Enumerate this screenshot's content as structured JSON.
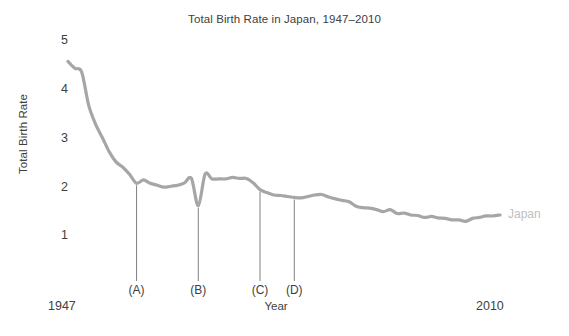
{
  "chart_data": {
    "type": "line",
    "title": "Total Birth Rate in Japan, 1947–2010",
    "xlabel": "Year",
    "ylabel": "Total Birth Rate",
    "xlim": [
      1947,
      2010
    ],
    "ylim": [
      0.55,
      5
    ],
    "grid": false,
    "legend_position": "right-inline",
    "x_tick_labels": [
      "1947",
      "2010"
    ],
    "y_tick_labels": [
      "5",
      "4",
      "3",
      "2",
      "1"
    ],
    "y_ticks": [
      5,
      4,
      3,
      2,
      1
    ],
    "line_color": "#a6a6a6",
    "label_color": "#bfbfbf",
    "series": [
      {
        "name": "Japan",
        "x": [
          1947,
          1948,
          1949,
          1950,
          1951,
          1952,
          1953,
          1954,
          1955,
          1956,
          1957,
          1958,
          1959,
          1960,
          1961,
          1962,
          1963,
          1964,
          1965,
          1966,
          1967,
          1968,
          1969,
          1970,
          1971,
          1972,
          1973,
          1974,
          1975,
          1976,
          1977,
          1978,
          1979,
          1980,
          1981,
          1982,
          1983,
          1984,
          1985,
          1986,
          1987,
          1988,
          1989,
          1990,
          1991,
          1992,
          1993,
          1994,
          1995,
          1996,
          1997,
          1998,
          1999,
          2000,
          2001,
          2002,
          2003,
          2004,
          2005,
          2006,
          2007,
          2008,
          2009,
          2010
        ],
        "values": [
          4.54,
          4.4,
          4.32,
          3.65,
          3.26,
          2.98,
          2.69,
          2.48,
          2.37,
          2.22,
          2.04,
          2.11,
          2.04,
          2.0,
          1.96,
          1.98,
          2.0,
          2.05,
          2.14,
          1.58,
          2.23,
          2.13,
          2.13,
          2.13,
          2.16,
          2.14,
          2.14,
          2.05,
          1.91,
          1.85,
          1.8,
          1.79,
          1.77,
          1.75,
          1.74,
          1.77,
          1.8,
          1.81,
          1.76,
          1.72,
          1.69,
          1.66,
          1.57,
          1.54,
          1.53,
          1.5,
          1.46,
          1.5,
          1.42,
          1.43,
          1.39,
          1.38,
          1.34,
          1.36,
          1.33,
          1.32,
          1.29,
          1.29,
          1.26,
          1.32,
          1.34,
          1.37,
          1.37,
          1.39
        ]
      }
    ],
    "annotations": [
      {
        "id": "A",
        "label": "(A)",
        "year": 1957,
        "value": 2.04
      },
      {
        "id": "B",
        "label": "(B)",
        "year": 1966,
        "value": 1.58
      },
      {
        "id": "C",
        "label": "(C)",
        "year": 1975,
        "value": 1.91
      },
      {
        "id": "D",
        "label": "(D)",
        "year": 1980,
        "value": 1.75
      }
    ]
  }
}
